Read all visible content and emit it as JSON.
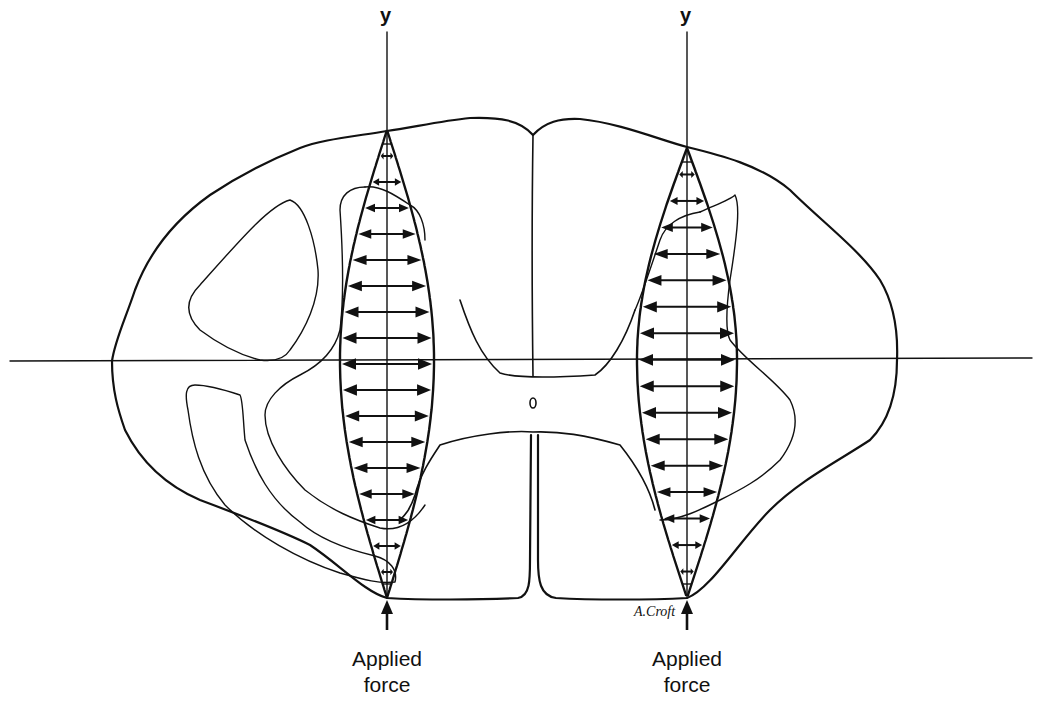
{
  "diagram": {
    "axes": {
      "left_y_label": "y",
      "right_y_label": "y",
      "horizontal_axis": true
    },
    "labels": {
      "left_force": [
        "Applied",
        "force"
      ],
      "right_force": [
        "Applied",
        "force"
      ],
      "signature": "A.Croft",
      "central_canal": "o"
    },
    "lenses": [
      {
        "side": "left",
        "axis_x": 387,
        "top_y": 130,
        "bottom_y": 598,
        "max_half_width": 47,
        "arrow_rows": 17
      },
      {
        "side": "right",
        "axis_x": 687,
        "top_y": 148,
        "bottom_y": 598,
        "max_half_width": 50,
        "arrow_rows": 16
      }
    ],
    "colors": {
      "line": "#111111",
      "background": "#ffffff"
    }
  }
}
